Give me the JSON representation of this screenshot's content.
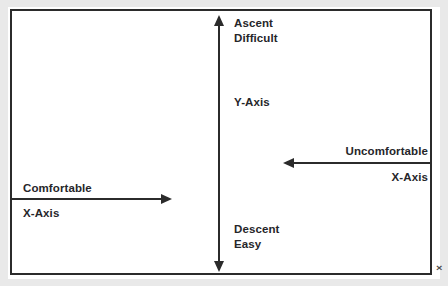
{
  "diagram": {
    "background_color": "#ffffff",
    "line_color": "#2b2b2b",
    "text_color": "#26262a",
    "vertical_axis": {
      "name": "Y-Axis",
      "axis_label": "Y-Axis",
      "top_label_line1": "Ascent",
      "top_label_line2": "Difficult",
      "bottom_label_line1": "Descent",
      "bottom_label_line2": "Easy",
      "direction": "double-headed vertical"
    },
    "left_axis": {
      "name": "Comfortable X-Axis",
      "label": "Comfortable",
      "axis_label": "X-Axis",
      "direction": "right"
    },
    "right_axis": {
      "name": "Uncomfortable X-Axis",
      "label": "Uncomfortable",
      "axis_label": "X-Axis",
      "direction": "left"
    },
    "artifact": {
      "glyph": "×"
    }
  }
}
